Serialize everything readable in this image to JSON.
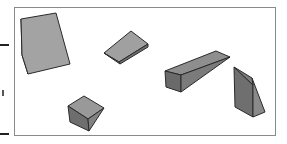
{
  "figure": {
    "shapes": [
      {
        "name": "tall-wedge",
        "position": "top-left"
      },
      {
        "name": "flat-wedge",
        "position": "top-center"
      },
      {
        "name": "long-wedge",
        "position": "center-right"
      },
      {
        "name": "upright-wedge",
        "position": "right"
      },
      {
        "name": "cube-wedge",
        "position": "bottom-center"
      }
    ],
    "colors": {
      "light_face": "#a3a3a3",
      "mid_face": "#8c8c8c",
      "dark_face": "#6e6e6e",
      "edge": "#2a2a2a",
      "frame": "#8a8a8a"
    }
  }
}
